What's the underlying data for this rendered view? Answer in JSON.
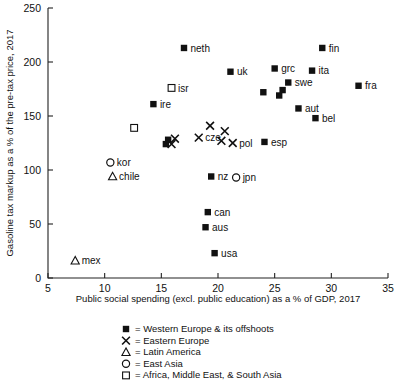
{
  "chart_data": {
    "type": "scatter",
    "title": "",
    "xlabel": "Public social spending (excl. public education) as a % of GDP, 2017",
    "ylabel": "Gasoline tax markup as a % of the pre-tax price, 2017",
    "xlim": [
      5,
      35
    ],
    "ylim": [
      0,
      250
    ],
    "xticks": [
      5,
      10,
      15,
      20,
      25,
      30,
      35
    ],
    "yticks": [
      0,
      50,
      100,
      150,
      200,
      250
    ],
    "grid": false,
    "legend_position": "below-axes",
    "series": [
      {
        "name": "Western Europe & its offshoots",
        "marker": "filled-square",
        "points": [
          {
            "label": "neth",
            "x": 17.0,
            "y": 213,
            "label_side": "right"
          },
          {
            "label": "fin",
            "x": 29.2,
            "y": 213,
            "label_side": "right"
          },
          {
            "label": "uk",
            "x": 21.1,
            "y": 191,
            "label_side": "right"
          },
          {
            "label": "grc",
            "x": 25.0,
            "y": 194,
            "label_side": "right"
          },
          {
            "label": "ita",
            "x": 28.3,
            "y": 192,
            "label_side": "right"
          },
          {
            "label": "swe",
            "x": 26.2,
            "y": 181,
            "label_side": "right"
          },
          {
            "label": "fra",
            "x": 32.4,
            "y": 178,
            "label_side": "right"
          },
          {
            "label": "ire",
            "x": 14.3,
            "y": 161,
            "label_side": "right"
          },
          {
            "label": "",
            "x": 24.0,
            "y": 172,
            "label_side": "right"
          },
          {
            "label": "",
            "x": 25.4,
            "y": 169,
            "label_side": "right"
          },
          {
            "label": "",
            "x": 25.7,
            "y": 174,
            "label_side": "right"
          },
          {
            "label": "bel",
            "x": 28.6,
            "y": 148,
            "label_side": "right"
          },
          {
            "label": "aut",
            "x": 27.1,
            "y": 157,
            "label_side": "right"
          },
          {
            "label": "esp",
            "x": 24.1,
            "y": 126,
            "label_side": "right"
          },
          {
            "label": "",
            "x": 15.4,
            "y": 124,
            "label_side": "right"
          },
          {
            "label": "",
            "x": 15.6,
            "y": 128,
            "label_side": "right"
          },
          {
            "label": "nz",
            "x": 19.4,
            "y": 94,
            "label_side": "right"
          },
          {
            "label": "can",
            "x": 19.1,
            "y": 61,
            "label_side": "right"
          },
          {
            "label": "aus",
            "x": 18.9,
            "y": 47,
            "label_side": "right"
          },
          {
            "label": "usa",
            "x": 19.7,
            "y": 23,
            "label_side": "right"
          }
        ]
      },
      {
        "name": "Eastern Europe",
        "marker": "x",
        "points": [
          {
            "label": "",
            "x": 19.3,
            "y": 141,
            "label_side": "right"
          },
          {
            "label": "cze",
            "x": 18.3,
            "y": 130,
            "label_side": "right"
          },
          {
            "label": "",
            "x": 20.6,
            "y": 136,
            "label_side": "right"
          },
          {
            "label": "",
            "x": 16.2,
            "y": 129,
            "label_side": "right"
          },
          {
            "label": "",
            "x": 15.9,
            "y": 124,
            "label_side": "right"
          },
          {
            "label": "pol",
            "x": 21.3,
            "y": 125,
            "label_side": "right"
          },
          {
            "label": "",
            "x": 20.3,
            "y": 127,
            "label_side": "right"
          }
        ]
      },
      {
        "name": "Latin America",
        "marker": "triangle",
        "points": [
          {
            "label": "chile",
            "x": 10.7,
            "y": 94,
            "label_side": "right"
          },
          {
            "label": "mex",
            "x": 7.4,
            "y": 16,
            "label_side": "right"
          }
        ]
      },
      {
        "name": "East Asia",
        "marker": "circle",
        "points": [
          {
            "label": "kor",
            "x": 10.5,
            "y": 107,
            "label_side": "right"
          },
          {
            "label": "jpn",
            "x": 21.6,
            "y": 93,
            "label_side": "right"
          }
        ]
      },
      {
        "name": "Africa, Middle East, & South Asia",
        "marker": "open-square",
        "points": [
          {
            "label": "isr",
            "x": 15.9,
            "y": 176,
            "label_side": "right"
          },
          {
            "label": "",
            "x": 12.6,
            "y": 139,
            "label_side": "right"
          }
        ]
      }
    ]
  },
  "legend": {
    "items": [
      {
        "marker": "filled-square",
        "equals": "=",
        "label": "Western Europe & its offshoots"
      },
      {
        "marker": "x",
        "equals": "=",
        "label": "Eastern Europe"
      },
      {
        "marker": "triangle",
        "equals": "=",
        "label": "Latin America"
      },
      {
        "marker": "circle",
        "equals": "=",
        "label": "East Asia"
      },
      {
        "marker": "open-square",
        "equals": "=",
        "label": "Africa, Middle East, & South Asia"
      }
    ]
  },
  "colors": {
    "marker": "#111111",
    "axis": "#222222",
    "background": "#ffffff"
  }
}
